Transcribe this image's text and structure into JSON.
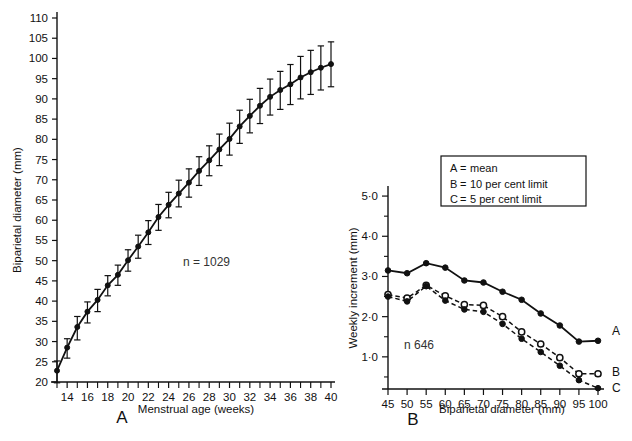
{
  "figure": {
    "panelA_letter": "A",
    "panelB_letter": "B"
  },
  "panelA": {
    "xlabel": "Menstrual age  (weeks)",
    "ylabel": "Biparietal diameter  (mm)",
    "n_label": "n = 1029",
    "ytick_labels": [
      "20",
      "25",
      "30",
      "35",
      "40",
      "45",
      "50",
      "55",
      "60",
      "65",
      "70",
      "75",
      "80",
      "85",
      "90",
      "95",
      "100",
      "105",
      "110"
    ],
    "xtick_labels": [
      "14",
      "16",
      "18",
      "20",
      "22",
      "24",
      "26",
      "28",
      "30",
      "32",
      "34",
      "36",
      "38",
      "40"
    ]
  },
  "panelB": {
    "xlabel": "Biparietal diameter  (mm)",
    "ylabel": "Weekly increment  (mm)",
    "n_label": "n  646",
    "ytick_labels": [
      "1·0",
      "2·0",
      "3·0",
      "4·0",
      "5·0"
    ],
    "xtick_labels": [
      "45",
      "50",
      "55",
      "60",
      "65",
      "70",
      "75",
      "80",
      "85",
      "90",
      "95",
      "100"
    ],
    "legend": {
      "items": [
        {
          "key": "A",
          "sep": "=",
          "text": "mean"
        },
        {
          "key": "B",
          "sep": "=",
          "text": "10 per cent limit"
        },
        {
          "key": "C",
          "sep": "=",
          "text": "5 per cent limit"
        }
      ]
    },
    "end_labels": {
      "a": "A",
      "b": "B",
      "c": "C"
    }
  },
  "chart_data": [
    {
      "type": "line",
      "id": "panel-A",
      "title": "A",
      "xlabel": "Menstrual age (weeks)",
      "ylabel": "Biparietal diameter (mm)",
      "xlim": [
        13,
        40
      ],
      "ylim": [
        20,
        110
      ],
      "xticks": [
        14,
        16,
        18,
        20,
        22,
        24,
        26,
        28,
        30,
        32,
        34,
        36,
        38,
        40
      ],
      "xminorticks": [
        13,
        15,
        17,
        19,
        21,
        23,
        25,
        27,
        29,
        31,
        33,
        35,
        37,
        39
      ],
      "yticks": [
        20,
        25,
        30,
        35,
        40,
        45,
        50,
        55,
        60,
        65,
        70,
        75,
        80,
        85,
        90,
        95,
        100,
        105,
        110
      ],
      "grid": false,
      "legend": "none",
      "annotation": "n = 1029",
      "errorbars": true,
      "x": [
        13,
        14,
        15,
        16,
        17,
        18,
        19,
        20,
        21,
        22,
        23,
        24,
        25,
        26,
        27,
        28,
        29,
        30,
        31,
        32,
        33,
        34,
        35,
        36,
        37,
        38,
        39,
        40
      ],
      "values": [
        22.8,
        28.5,
        33.6,
        37.4,
        40.3,
        43.9,
        46.5,
        50.1,
        53.5,
        57.0,
        60.8,
        63.8,
        66.6,
        69.3,
        72.2,
        74.8,
        77.5,
        80.1,
        83.2,
        85.8,
        88.3,
        90.5,
        92.2,
        93.6,
        95.3,
        96.6,
        97.7,
        98.6
      ],
      "err_low": [
        3.0,
        2.6,
        3.2,
        2.8,
        2.9,
        2.6,
        2.6,
        2.7,
        2.9,
        3.0,
        3.3,
        3.2,
        3.3,
        3.6,
        3.6,
        3.8,
        4.0,
        4.0,
        4.2,
        4.2,
        4.4,
        4.5,
        4.8,
        5.0,
        5.3,
        5.5,
        5.5,
        5.6
      ],
      "err_high": [
        2.4,
        2.2,
        2.6,
        2.4,
        2.6,
        2.4,
        2.4,
        2.6,
        2.8,
        2.9,
        3.1,
        3.1,
        3.3,
        3.4,
        3.5,
        3.6,
        3.8,
        3.9,
        4.0,
        4.1,
        4.3,
        4.4,
        4.6,
        4.9,
        5.2,
        5.4,
        5.4,
        5.5
      ],
      "series": [
        {
          "name": "mean BPD",
          "marker": "filled-circle",
          "line": "solid"
        }
      ]
    },
    {
      "type": "line",
      "id": "panel-B",
      "title": "B",
      "xlabel": "Biparietal diameter (mm)",
      "ylabel": "Weekly increment (mm)",
      "xlim": [
        45,
        100
      ],
      "ylim": [
        0.2,
        5.4
      ],
      "xticks": [
        45,
        50,
        55,
        60,
        65,
        70,
        75,
        80,
        85,
        90,
        95,
        100
      ],
      "yticks": [
        1.0,
        2.0,
        3.0,
        4.0,
        5.0
      ],
      "yminorticks": [
        0.5,
        1.5,
        2.5,
        3.5,
        4.5
      ],
      "grid": false,
      "legend": "inside-top-right",
      "annotation": "n  646",
      "categories": [
        45,
        50,
        55,
        60,
        65,
        70,
        75,
        80,
        85,
        90,
        95,
        100
      ],
      "series": [
        {
          "name": "A",
          "label": "mean",
          "marker": "filled-circle",
          "line": "solid",
          "values": [
            3.15,
            3.08,
            3.33,
            3.22,
            2.9,
            2.85,
            2.62,
            2.42,
            2.08,
            1.78,
            1.38,
            1.4
          ]
        },
        {
          "name": "B",
          "label": "10 per cent limit",
          "marker": "open-circle",
          "line": "dashed",
          "values": [
            2.55,
            2.46,
            2.78,
            2.52,
            2.3,
            2.28,
            2.0,
            1.62,
            1.32,
            0.98,
            0.58,
            0.58
          ]
        },
        {
          "name": "C",
          "label": "5 per cent limit",
          "marker": "filled-circle",
          "line": "dashed",
          "values": [
            2.5,
            2.38,
            2.76,
            2.4,
            2.18,
            2.12,
            1.82,
            1.45,
            1.12,
            0.78,
            0.42,
            0.22
          ]
        }
      ]
    }
  ]
}
